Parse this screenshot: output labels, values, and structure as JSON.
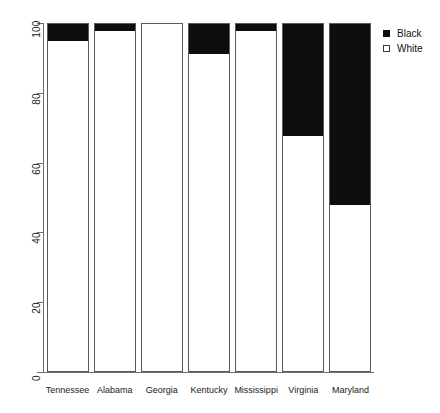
{
  "chart_data": {
    "type": "bar",
    "stacked": true,
    "stacked_mode": "percent",
    "title": "",
    "subtitle": "",
    "xlabel": "",
    "ylabel": "",
    "categories": [
      "Tennessee",
      "Alabama",
      "Georgia",
      "Kentucky",
      "Mississippi",
      "Virginia",
      "Maryland"
    ],
    "series": [
      {
        "name": "Black",
        "color": "#0d0d0d",
        "values": [
          5,
          2,
          0,
          8.5,
          2,
          32,
          52
        ]
      },
      {
        "name": "White",
        "color": "#ffffff",
        "values": [
          95,
          98,
          100,
          91.5,
          98,
          68,
          48
        ]
      }
    ],
    "ylim": [
      0,
      100
    ],
    "yticks": [
      0,
      20,
      40,
      60,
      80,
      100
    ],
    "ytick_labels": [
      "0",
      "20",
      "40",
      "60",
      "80",
      "100"
    ],
    "grid": false,
    "legend_position": "top-right",
    "legend_entries": [
      {
        "label": "Black",
        "marker": "filled-square",
        "color": "#0d0d0d"
      },
      {
        "label": "White",
        "marker": "open-square",
        "color": "#ffffff"
      }
    ]
  },
  "axes": {
    "y_tick_labels": [
      "100",
      "80",
      "60",
      "40",
      "20",
      "0"
    ],
    "x_tick_labels": [
      "Tennessee",
      "Alabama",
      "Georgia",
      "Kentucky",
      "Mississippi",
      "Virginia",
      "Maryland"
    ]
  },
  "legend": {
    "items": [
      {
        "label": "Black"
      },
      {
        "label": "White"
      }
    ]
  },
  "colors": {
    "black_fill": "#0d0d0d",
    "white_fill": "#ffffff",
    "axis": "#6e6e6e",
    "bar_border": "#5a5a5a",
    "background": "#ffffff",
    "text": "#1a1a1a"
  }
}
